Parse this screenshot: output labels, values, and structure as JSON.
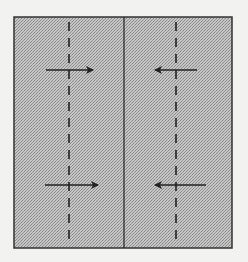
{
  "diagram": {
    "type": "origami-fold-step",
    "background": "#f2f2f0",
    "paper": {
      "x": 14,
      "y": 17,
      "width": 218,
      "height": 231,
      "fill": "#b8b8b8",
      "stroke": "#333333"
    },
    "center_line": {
      "x": 124,
      "y1": 17,
      "y2": 248,
      "style": "solid"
    },
    "fold_lines": [
      {
        "name": "left-valley-fold",
        "x": 69,
        "y1": 22,
        "y2": 246,
        "style": "dashed"
      },
      {
        "name": "right-valley-fold",
        "x": 176,
        "y1": 22,
        "y2": 246,
        "style": "dashed"
      }
    ],
    "arrows": [
      {
        "name": "arrow-top-left",
        "x1": 46,
        "y1": 70,
        "x2": 93,
        "y2": 70,
        "direction": "right"
      },
      {
        "name": "arrow-top-right",
        "x1": 197,
        "y1": 70,
        "x2": 155,
        "y2": 70,
        "direction": "left"
      },
      {
        "name": "arrow-bottom-left",
        "x1": 45,
        "y1": 185,
        "x2": 98,
        "y2": 185,
        "direction": "right"
      },
      {
        "name": "arrow-bottom-right",
        "x1": 206,
        "y1": 185,
        "x2": 155,
        "y2": 185,
        "direction": "left"
      }
    ]
  }
}
